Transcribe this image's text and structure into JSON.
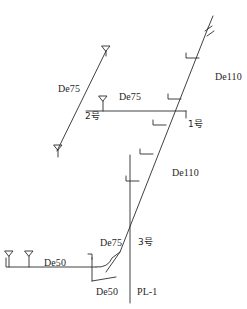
{
  "diagram": {
    "type": "piping-riser-isometric",
    "title": "",
    "stroke_color": "#2b2b2b",
    "background_color": "#ffffff",
    "labels": [
      {
        "id": "de75-upper-left",
        "text": "De75",
        "x": 58,
        "y": 84,
        "kind": "pipe-size"
      },
      {
        "id": "de75-horizontal",
        "text": "De75",
        "x": 119,
        "y": 92,
        "kind": "pipe-size"
      },
      {
        "id": "node-2",
        "text": "2号",
        "x": 85,
        "y": 112,
        "kind": "node-tag"
      },
      {
        "id": "node-1",
        "text": "1号",
        "x": 188,
        "y": 120,
        "kind": "node-tag"
      },
      {
        "id": "de110-upper",
        "text": "De110",
        "x": 215,
        "y": 72,
        "kind": "pipe-size"
      },
      {
        "id": "de110-lower",
        "text": "De110",
        "x": 172,
        "y": 168,
        "kind": "pipe-size"
      },
      {
        "id": "de75-lower",
        "text": "De75",
        "x": 100,
        "y": 238,
        "kind": "pipe-size"
      },
      {
        "id": "node-3",
        "text": "3号",
        "x": 138,
        "y": 238,
        "kind": "node-tag"
      },
      {
        "id": "de50-horizontal",
        "text": "De50",
        "x": 44,
        "y": 258,
        "kind": "pipe-size"
      },
      {
        "id": "de50-branch",
        "text": "De50",
        "x": 96,
        "y": 287,
        "kind": "pipe-size"
      },
      {
        "id": "property-line",
        "text": "PL-1",
        "x": 137,
        "y": 287,
        "kind": "line-tag"
      }
    ],
    "pipes": [
      {
        "id": "main-riser-de110",
        "size": "De110",
        "from": [
          120,
          298
        ],
        "to": [
          214,
          18
        ]
      },
      {
        "id": "branch-de75-upper-left",
        "size": "De75",
        "from": [
          45,
          155
        ],
        "to": [
          106,
          48
        ]
      },
      {
        "id": "branch-de75-horizontal",
        "size": "De75",
        "from": [
          89,
          110
        ],
        "to": [
          185,
          110
        ]
      },
      {
        "id": "branch-de50-horizontal",
        "size": "De50",
        "from": [
          6,
          267
        ],
        "to": [
          103,
          267
        ]
      },
      {
        "id": "property-line-pl1",
        "size": "PL-1",
        "from": [
          130,
          155
        ],
        "to": [
          130,
          303
        ]
      }
    ],
    "symbols": [
      {
        "id": "fixture-top-branch",
        "name": "riser-terminal-icon",
        "x": 106,
        "y": 48
      },
      {
        "id": "fixture-mid-branch",
        "name": "riser-terminal-icon",
        "x": 103,
        "y": 99
      },
      {
        "id": "fixture-lower-branch",
        "name": "riser-terminal-icon",
        "x": 58,
        "y": 148
      },
      {
        "id": "fixture-de50-a",
        "name": "riser-terminal-icon",
        "x": 9,
        "y": 255
      },
      {
        "id": "fixture-de50-b",
        "name": "riser-terminal-icon",
        "x": 29,
        "y": 255
      },
      {
        "id": "break-symbol-top",
        "name": "pipe-break-icon",
        "x": 212,
        "y": 20
      },
      {
        "id": "stub-riser-1",
        "name": "branch-stub-icon",
        "x": 196,
        "y": 57
      },
      {
        "id": "stub-riser-2",
        "name": "branch-stub-icon",
        "x": 178,
        "y": 98
      },
      {
        "id": "stub-riser-3",
        "name": "branch-stub-icon",
        "x": 163,
        "y": 124
      },
      {
        "id": "stub-riser-4",
        "name": "branch-stub-icon",
        "x": 150,
        "y": 153
      },
      {
        "id": "stub-riser-5",
        "name": "branch-stub-icon",
        "x": 136,
        "y": 180
      },
      {
        "id": "stub-de50-elbow",
        "name": "branch-stub-icon",
        "x": 90,
        "y": 258
      }
    ]
  }
}
